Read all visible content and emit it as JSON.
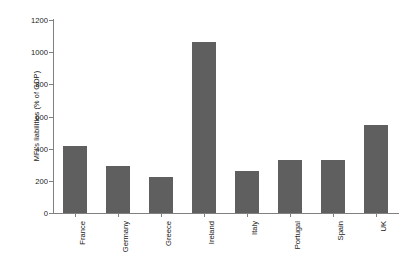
{
  "chart_data": {
    "type": "bar",
    "title": "",
    "subtitle": "",
    "xlabel": "",
    "ylabel": "MFI's liabilities (% of GDP)",
    "categories": [
      "France",
      "Germany",
      "Greece",
      "Ireland",
      "Italy",
      "Portugal",
      "Spain",
      "UK"
    ],
    "values": [
      418,
      295,
      225,
      1063,
      260,
      328,
      332,
      550
    ],
    "series": [
      {
        "name": "MFI's liabilities (% of GDP)",
        "values": [
          418,
          295,
          225,
          1063,
          260,
          328,
          332,
          550
        ]
      }
    ],
    "ylim": [
      0,
      1200
    ],
    "y_ticks": [
      0,
      200,
      400,
      600,
      800,
      1000,
      1200
    ],
    "y_tick_labels": [
      "0",
      "200",
      "400",
      "600",
      "800",
      "1000",
      "1200"
    ],
    "grid": false,
    "legend": false,
    "legend_position": "none",
    "bar_color": "#5f5f5f",
    "axis_color": "#808080",
    "text_color": "#1a1a1a",
    "background_color": "#ffffff"
  }
}
